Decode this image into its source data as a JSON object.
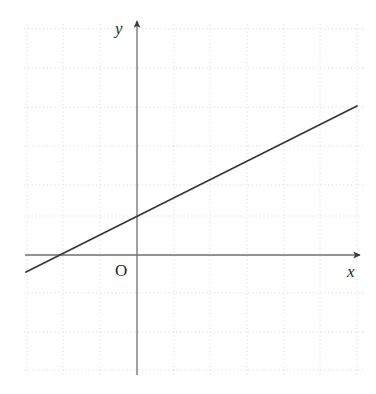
{
  "figure": {
    "background_color": "#ffffff",
    "width": 376,
    "height": 394
  },
  "labels": {
    "y_axis": "y",
    "x_axis": "x",
    "origin": "O"
  },
  "colors": {
    "grid": "#dcdcdc",
    "axis": "#6f6f6f",
    "line": "#3a3a3a",
    "text": "#2a2a2a",
    "background": "#ffffff"
  },
  "chart_data": {
    "type": "line",
    "title": "",
    "subtitle": "",
    "xlabel": "x",
    "ylabel": "y",
    "origin_label": "O",
    "grid": true,
    "grid_style": "dotted",
    "legend": "none",
    "axis_arrows": true,
    "tick_labels_shown": false,
    "xlim": [
      -3,
      6.2
    ],
    "ylim": [
      -3.1,
      5.9
    ],
    "x_unit_px": 36.7,
    "y_unit_px": 39.0,
    "origin_px": [
      137,
      255
    ],
    "x_gridlines_px": [
      27,
      63,
      100,
      137,
      174,
      210,
      247,
      284,
      320,
      357
    ],
    "y_gridlines_px": [
      29,
      68,
      107,
      146,
      185,
      216,
      255,
      293,
      332,
      370
    ],
    "axes": {
      "x_axis": {
        "start_px": [
          25,
          255
        ],
        "end_px": [
          362,
          255
        ],
        "arrow_at": "end"
      },
      "y_axis": {
        "start_px": [
          137,
          375
        ],
        "end_px": [
          137,
          18
        ],
        "arrow_at": "end"
      }
    },
    "series": [
      {
        "name": "line",
        "equation": "y = 0.45x + 1.05",
        "slope": 0.45,
        "intercept": 1.05,
        "x_intercept": -2.3,
        "endpoints_px": [
          [
            26,
            272
          ],
          [
            357,
            106
          ]
        ],
        "endpoints_data": [
          [
            -3.02,
            -0.44
          ],
          [
            5.99,
            3.82
          ]
        ],
        "x": [
          -3.02,
          5.99
        ],
        "values": [
          -0.44,
          3.82
        ]
      }
    ]
  }
}
